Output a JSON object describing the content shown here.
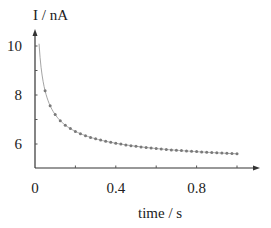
{
  "chart_data": {
    "type": "scatter",
    "title": "",
    "xlabel": "time / s",
    "ylabel": "I / nA",
    "xlim": [
      0,
      1.05
    ],
    "ylim": [
      5,
      10.6
    ],
    "x_ticks": [
      0,
      0.2,
      0.4,
      0.6,
      0.8,
      1.0
    ],
    "x_tick_labels": [
      "0",
      "0.4",
      "0.8"
    ],
    "x_tick_label_values": [
      0,
      0.4,
      0.8
    ],
    "y_ticks": [
      6,
      7,
      8,
      9,
      10
    ],
    "y_tick_labels": [
      "6",
      "8",
      "10"
    ],
    "y_tick_label_values": [
      6,
      8,
      10
    ],
    "grid": false,
    "legend": null,
    "series": [
      {
        "name": "measured current",
        "style": "markers",
        "color": "#7a7a7a",
        "model": "I = 4.86 + 0.74/sqrt(t)",
        "x": [
          0.05,
          0.075,
          0.1,
          0.125,
          0.15,
          0.175,
          0.2,
          0.225,
          0.25,
          0.275,
          0.3,
          0.325,
          0.35,
          0.375,
          0.4,
          0.425,
          0.45,
          0.475,
          0.5,
          0.525,
          0.55,
          0.575,
          0.6,
          0.625,
          0.65,
          0.675,
          0.7,
          0.725,
          0.75,
          0.775,
          0.8,
          0.825,
          0.85,
          0.875,
          0.9,
          0.925,
          0.95,
          0.975,
          1.0
        ],
        "y": [
          8.17,
          7.56,
          7.2,
          6.95,
          6.77,
          6.63,
          6.51,
          6.42,
          6.34,
          6.27,
          6.21,
          6.16,
          6.11,
          6.07,
          6.03,
          6.0,
          5.96,
          5.93,
          5.91,
          5.88,
          5.86,
          5.84,
          5.82,
          5.8,
          5.78,
          5.76,
          5.74,
          5.73,
          5.71,
          5.7,
          5.69,
          5.67,
          5.66,
          5.65,
          5.64,
          5.63,
          5.62,
          5.61,
          5.6
        ]
      },
      {
        "name": "fit",
        "style": "line",
        "color": "#9a9a9a",
        "x": [
          0.02,
          0.03,
          0.04,
          0.05,
          0.075,
          0.1,
          0.15,
          0.2,
          0.3,
          0.4,
          0.5,
          0.6,
          0.7,
          0.8,
          0.9,
          1.0
        ],
        "y": [
          10.09,
          9.13,
          8.56,
          8.17,
          7.56,
          7.2,
          6.77,
          6.51,
          6.21,
          6.03,
          5.91,
          5.82,
          5.74,
          5.69,
          5.64,
          5.6
        ]
      }
    ]
  }
}
